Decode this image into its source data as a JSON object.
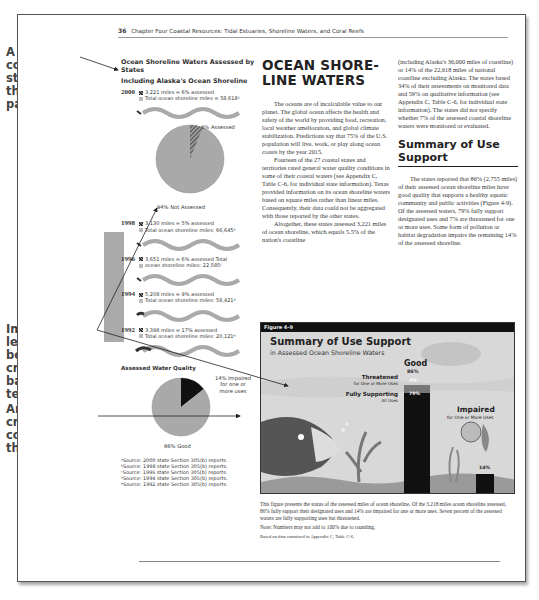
{
  "annotations": [
    {
      "text": "A three-column layout structures the whole page."
    },
    {
      "text": "Images on left and bottom create balance with text."
    },
    {
      "text": "An image can cross two columns, as this one does."
    }
  ],
  "running_head": {
    "page_number": "36",
    "text": "Chapter Four  Coastal Resources: Tidal Estuaries, Shoreline Waters, and Coral Reefs"
  },
  "left_column": {
    "title": "Ocean Shoreline Waters Assessed by States",
    "subtitle": "Including Alaska's Ocean Shoreline",
    "years": [
      {
        "year": "2000",
        "assessed": "3,221 miles = 6% assessed",
        "total": "Total ocean shoreline miles = 58,618ᵃ"
      },
      {
        "year": "1998",
        "assessed": "3,130 miles = 5% assessed",
        "total": "Total ocean shoreline miles: 66,645ᵇ"
      },
      {
        "year": "1996",
        "assessed": "3,651 miles = 6% assessed Total",
        "total": "ocean shoreline miles: 22,585ᶜ"
      },
      {
        "year": "1994",
        "assessed": "5,208 miles = 9% assessed",
        "total": "Total ocean shoreline miles: 58,421ᵈ"
      },
      {
        "year": "1992",
        "assessed": "3,398 miles = 17% assessed",
        "total": "Total ocean shoreline miles: 20,121ᵉ"
      }
    ],
    "pie_2000": {
      "assessed_label": "6% Assessed",
      "not_assessed_label": "94% Not Assessed"
    },
    "water_quality": {
      "title": "Assessed Water Quality",
      "impaired_label": "14% Impaired for one or more uses",
      "good_label": "86% Good"
    },
    "sources": [
      "ᵃSource:  2000 state Section 305(b) reports.",
      "ᵇSource:  1998 state Section 305(b) reports.",
      "ᶜSource:  1996 state Section 305(b) reports.",
      "ᵈSource:  1994 state Section 305(b) reports.",
      "ᵉSource:  1992 state Section 305(b) reports."
    ]
  },
  "middle_column": {
    "heading": "OCEAN SHORE-LINE WATERS",
    "paragraphs": [
      "The oceans are of incalculable value to our planet. The global ocean affects the health and safety of the world by providing food, recreation, local weather amelioration, and global climate stabilization. Predictions say that 75% of the U.S. population will live, work, or play along ocean coasts by the year 2015.",
      "Fourteen of the 27 coastal states and territories rated general water quality conditions in some of their coastal waters (see Appendix C, Table C-6, for individual state information). Texas provided information on its ocean shoreline waters based on square miles rather than linear miles. Consequently, their data could not be aggregated with those reported by the other states.",
      "Altogether, these states assessed 3,221 miles of ocean shoreline, which equals 5.5% of the nation's coastline"
    ]
  },
  "right_column": {
    "continuation": "(including Alaska's 36,000 miles of coastline) or 14% of the 22,618 miles of national coastline excluding Alaska. The states based 34% of their assessments on monitored data and 59% on qualitative information (see Appendix C, Table C-6, for individual state information). The states did not specify whether 7% of the assessed coastal shoreline waters were monitored or evaluated.",
    "heading": "Summary of Use Support",
    "paragraph": "The states reported that 86% (2,755 miles) of their assessed ocean shoreline miles have good quality that supports a healthy aquatic community and public activities (Figure 4-9). Of the assessed waters, 79% fully support designated uses and 7% are threatened for one or more uses. Some form of pollution or habitat degradation impairs the remaining 14% of the assessed shoreline."
  },
  "figure": {
    "label": "Figure 4-9",
    "title": "Summary of Use Support",
    "subtitle": "in Assessed Ocean Shoreline Waters",
    "good_label": "Good",
    "good_value": "86%",
    "threatened_label": "Threatened",
    "threatened_sub": "for One or More Uses",
    "threatened_value": "7%",
    "fully_label": "Fully Supporting",
    "fully_sub": "All Uses",
    "fully_value": "79%",
    "impaired_label": "Impaired",
    "impaired_sub": "for One or More Uses",
    "impaired_value": "14%",
    "caption": "This figure presents the status of the assessed miles of ocean shoreline. Of the 3,218 miles ocean shoreline assessed, 86% fully support their designated uses and 14% are impaired for one or more uses. Seven percent of the assessed waters are fully supporting uses but threatened.",
    "note": "Note:  Numbers may not add to 100% due to rounding.",
    "based_on": "Based on data contained in Appendix C, Table C-6."
  },
  "colors": {
    "pie_gray": "#a9a9a9",
    "impaired_black": "#111111",
    "figure_bg": "#d8d8d8",
    "sidebar_block": "#aaaaaa"
  }
}
